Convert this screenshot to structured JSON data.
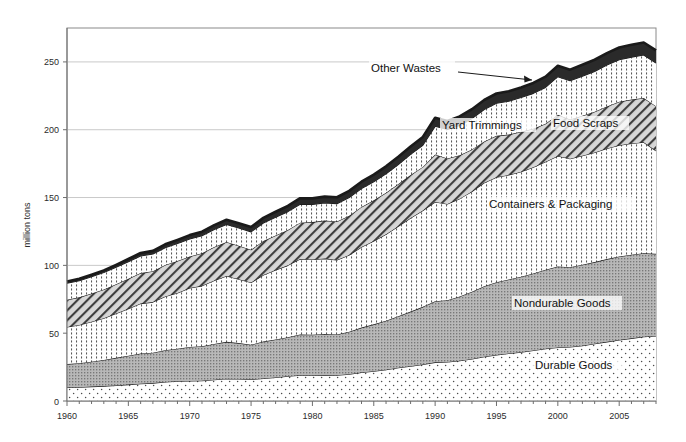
{
  "chart_data": {
    "type": "area",
    "stacked": true,
    "title": "",
    "subtitle": "",
    "xlabel": "",
    "ylabel": "million tons",
    "xlim": [
      1960,
      2008
    ],
    "ylim": [
      0,
      275
    ],
    "yticks": [
      0,
      50,
      100,
      150,
      200,
      250
    ],
    "ytick_labels": [
      "0",
      "50",
      "100",
      "150",
      "200",
      "250"
    ],
    "xticks": [
      1960,
      1965,
      1970,
      1975,
      1980,
      1985,
      1990,
      1995,
      2000,
      2005
    ],
    "xtick_labels": [
      "1960",
      "1965",
      "1970",
      "1975",
      "1980",
      "1985",
      "1990",
      "1995",
      "2000",
      "2005"
    ],
    "minor_xtick_interval": 1,
    "grid": "horizontal",
    "legend_position": "inline-annotations",
    "x": [
      1960,
      1961,
      1962,
      1963,
      1964,
      1965,
      1966,
      1967,
      1968,
      1969,
      1970,
      1971,
      1972,
      1973,
      1974,
      1975,
      1976,
      1977,
      1978,
      1979,
      1980,
      1981,
      1982,
      1983,
      1984,
      1985,
      1986,
      1987,
      1988,
      1989,
      1990,
      1991,
      1992,
      1993,
      1994,
      1995,
      1996,
      1997,
      1998,
      1999,
      2000,
      2001,
      2002,
      2003,
      2004,
      2005,
      2006,
      2007,
      2008
    ],
    "series": [
      {
        "name": "Durable Goods",
        "fill_pattern": "sparse-dots",
        "values": [
          9.9,
          10.2,
          10.6,
          11.0,
          11.5,
          12.1,
          12.8,
          13.2,
          14.0,
          14.6,
          14.7,
          15.0,
          15.7,
          16.4,
          16.2,
          15.8,
          16.6,
          17.4,
          18.2,
          19.0,
          19.0,
          19.2,
          19.0,
          19.8,
          21.1,
          22.0,
          23.0,
          24.5,
          25.7,
          27.0,
          28.5,
          28.8,
          29.7,
          31.0,
          32.6,
          34.0,
          35.0,
          36.0,
          37.2,
          38.5,
          39.5,
          39.8,
          40.8,
          42.2,
          43.6,
          45.0,
          46.2,
          47.4,
          48.0
        ]
      },
      {
        "name": "Nondurable Goods",
        "fill_pattern": "dense-dots-gray",
        "values": [
          17.3,
          17.7,
          18.4,
          19.2,
          20.3,
          21.3,
          22.2,
          22.4,
          23.5,
          24.0,
          25.1,
          25.4,
          26.4,
          27.2,
          26.5,
          25.7,
          27.2,
          28.0,
          28.8,
          30.1,
          29.9,
          30.2,
          30.1,
          31.2,
          33.0,
          34.5,
          36.2,
          38.0,
          40.2,
          42.4,
          45.1,
          45.5,
          47.3,
          49.5,
          52.0,
          53.5,
          54.6,
          55.6,
          56.8,
          58.3,
          59.7,
          58.8,
          59.6,
          60.2,
          61.0,
          61.5,
          61.6,
          61.6,
          60.5
        ]
      },
      {
        "name": "Containers & Packaging",
        "fill_pattern": "vertical-dotted",
        "values": [
          27.4,
          28.2,
          29.5,
          30.9,
          32.7,
          34.7,
          36.8,
          37.3,
          39.6,
          41.1,
          43.6,
          44.5,
          46.8,
          48.6,
          47.1,
          45.8,
          49.1,
          51.1,
          53.0,
          55.6,
          55.5,
          55.6,
          54.8,
          56.6,
          59.4,
          61.5,
          63.8,
          66.3,
          69.0,
          71.0,
          73.1,
          71.0,
          72.2,
          74.0,
          76.3,
          77.5,
          77.0,
          77.4,
          78.3,
          79.6,
          81.4,
          80.0,
          80.5,
          80.8,
          81.6,
          82.0,
          82.0,
          81.8,
          76.0
        ]
      },
      {
        "name": "Yard Trimmings",
        "fill_pattern": "diagonal-hatch",
        "values": [
          20.0,
          20.3,
          20.7,
          21.1,
          21.6,
          22.0,
          22.5,
          22.8,
          23.2,
          23.6,
          23.2,
          24.0,
          24.6,
          25.0,
          24.6,
          24.2,
          25.0,
          25.6,
          26.1,
          26.8,
          27.5,
          28.0,
          28.4,
          29.0,
          29.6,
          30.0,
          30.5,
          31.1,
          31.7,
          32.2,
          35.0,
          33.5,
          32.0,
          31.0,
          30.5,
          30.5,
          29.8,
          29.5,
          28.5,
          28.0,
          30.5,
          29.0,
          29.4,
          30.0,
          31.0,
          32.1,
          32.4,
          32.6,
          32.9
        ]
      },
      {
        "name": "Food Scraps",
        "fill_pattern": "vertical-dotted",
        "values": [
          12.2,
          12.3,
          12.4,
          12.5,
          12.5,
          12.6,
          12.6,
          12.7,
          12.7,
          12.8,
          12.8,
          12.9,
          13.0,
          13.0,
          13.1,
          13.2,
          13.3,
          13.4,
          13.5,
          13.6,
          13.0,
          13.1,
          13.2,
          13.4,
          13.5,
          13.6,
          14.0,
          14.5,
          15.2,
          16.0,
          20.8,
          21.3,
          22.0,
          22.8,
          23.5,
          24.0,
          24.6,
          25.2,
          26.0,
          26.8,
          28.0,
          28.5,
          29.2,
          29.8,
          30.5,
          31.0,
          31.3,
          31.7,
          31.8
        ]
      },
      {
        "name": "Other Wastes",
        "fill_pattern": "solid-black",
        "values": [
          1.3,
          1.4,
          1.5,
          1.6,
          1.8,
          2.0,
          2.2,
          2.3,
          2.5,
          2.7,
          2.9,
          3.0,
          3.2,
          3.4,
          3.5,
          3.6,
          3.8,
          4.0,
          4.2,
          4.4,
          4.5,
          4.6,
          4.7,
          4.9,
          5.1,
          5.3,
          5.5,
          5.7,
          5.9,
          6.1,
          6.3,
          6.4,
          6.6,
          6.8,
          7.0,
          7.2,
          7.4,
          7.5,
          7.7,
          7.9,
          8.1,
          8.2,
          8.4,
          8.6,
          8.8,
          9.0,
          9.1,
          9.2,
          9.3
        ]
      }
    ],
    "annotations": [
      {
        "text": "Other Wastes",
        "target_series": "Other Wastes",
        "has_leader_line": true
      },
      {
        "text": "Yard Trimmings",
        "target_series": "Yard Trimmings",
        "has_leader_line": false
      },
      {
        "text": "Food Scraps",
        "target_series": "Food Scraps",
        "has_leader_line": false
      },
      {
        "text": "Containers & Packaging",
        "target_series": "Containers & Packaging",
        "has_leader_line": false
      },
      {
        "text": "Nondurable Goods",
        "target_series": "Nondurable Goods",
        "has_leader_line": false
      },
      {
        "text": "Durable Goods",
        "target_series": "Durable Goods",
        "has_leader_line": false
      }
    ]
  },
  "axis": {
    "ylabel": "million tons"
  },
  "labels": {
    "other_wastes": "Other Wastes",
    "yard_trimmings": "Yard Trimmings",
    "food_scraps": "Food Scraps",
    "containers_packaging": "Containers & Packaging",
    "nondurable_goods": "Nondurable Goods",
    "durable_goods": "Durable Goods"
  },
  "colors": {
    "axis": "#6e6e6e",
    "grid": "#c9c9c9",
    "outline": "#1a1a1a",
    "text": "#1a1a1a",
    "other_wastes_fill": "#2a2a2a",
    "nondurable_fill": "#b4b4b4",
    "background": "#ffffff"
  }
}
